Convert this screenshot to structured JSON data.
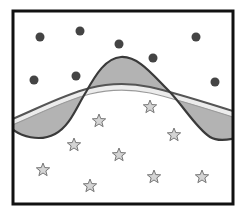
{
  "diagram": {
    "title": "",
    "frame": {
      "x": 13,
      "y": 11,
      "width": 220,
      "height": 193,
      "stroke": "#111111",
      "stroke_width": 3
    },
    "colors": {
      "background": "#ffffff",
      "circle_fill": "#444444",
      "star_fill": "#d4d4d4",
      "star_stroke": "#777777",
      "shade_fill": "#b3b3b3",
      "wiggly_stroke": "#3a3a3a",
      "smooth_stroke": "#555555",
      "smooth_highlight": "#ececec"
    },
    "circles": [
      {
        "x": 40,
        "y": 37
      },
      {
        "x": 80,
        "y": 31
      },
      {
        "x": 119,
        "y": 44
      },
      {
        "x": 153,
        "y": 58
      },
      {
        "x": 196,
        "y": 37
      },
      {
        "x": 34,
        "y": 80
      },
      {
        "x": 76,
        "y": 76
      },
      {
        "x": 215,
        "y": 82
      }
    ],
    "stars": [
      {
        "x": 150,
        "y": 107
      },
      {
        "x": 99,
        "y": 121
      },
      {
        "x": 74,
        "y": 145
      },
      {
        "x": 174,
        "y": 135
      },
      {
        "x": 119,
        "y": 155
      },
      {
        "x": 43,
        "y": 170
      },
      {
        "x": 90,
        "y": 186
      },
      {
        "x": 154,
        "y": 177
      },
      {
        "x": 202,
        "y": 177
      }
    ],
    "curves": {
      "wiggly_label": "overfit boundary",
      "smooth_label": "smooth boundary"
    }
  }
}
